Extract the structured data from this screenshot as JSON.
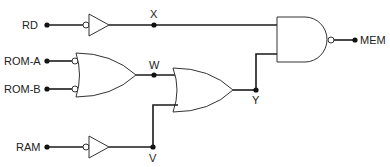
{
  "diagram": {
    "type": "logic-circuit",
    "inputs": [
      {
        "id": "rd",
        "label": "RD"
      },
      {
        "id": "rom_a",
        "label": "ROM-A"
      },
      {
        "id": "rom_b",
        "label": "ROM-B"
      },
      {
        "id": "ram",
        "label": "RAM"
      }
    ],
    "output": {
      "id": "mem",
      "label": "MEM"
    },
    "nodes": {
      "x": "X",
      "w": "W",
      "y": "Y",
      "v": "V"
    },
    "gates": [
      {
        "id": "inv_rd",
        "type": "buffer-with-input-bubble",
        "input": "RD",
        "output": "X"
      },
      {
        "id": "or1",
        "type": "OR-with-inverted-inputs",
        "inputs": [
          "ROM-A",
          "ROM-B"
        ],
        "output": "W"
      },
      {
        "id": "inv_ram",
        "type": "buffer-with-input-bubble",
        "input": "RAM",
        "output": "V"
      },
      {
        "id": "or2",
        "type": "OR",
        "inputs": [
          "W",
          "V"
        ],
        "output": "Y"
      },
      {
        "id": "nand",
        "type": "NAND",
        "inputs": [
          "X",
          "Y"
        ],
        "output": "MEM"
      }
    ]
  }
}
